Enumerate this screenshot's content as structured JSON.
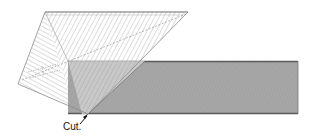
{
  "diagram": {
    "labels": {
      "cut": "Cut."
    },
    "colors": {
      "background": "#ffffff",
      "hatch": "#9a9a9a",
      "outline": "#8a8a8a",
      "band_fill": "#a9a9a9",
      "band_light_fill": "#cfcfcf",
      "band_edge": "#5a5a5a",
      "arrow": "#111111"
    },
    "shapes": {
      "triangle_vertices": [
        [
          45,
          12
        ],
        [
          188,
          12
        ],
        [
          88,
          114
        ],
        [
          18,
          84
        ]
      ],
      "band": {
        "x": 68,
        "y": 61,
        "width": 230,
        "height": 53
      },
      "fold_diagonal": [
        [
          88,
          114
        ],
        [
          145,
          61
        ]
      ]
    }
  }
}
